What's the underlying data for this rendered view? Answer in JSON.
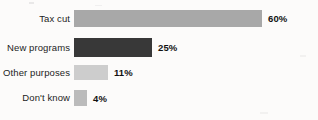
{
  "chart_data": {
    "type": "bar",
    "orientation": "horizontal",
    "title": "",
    "xlabel": "",
    "ylabel": "",
    "grid": false,
    "legend": null,
    "axis_visible": false,
    "xlim": [
      0,
      60
    ],
    "categories": [
      "Tax cut",
      "New programs",
      "Other purposes",
      "Don't know"
    ],
    "values": [
      60,
      25,
      11,
      4
    ],
    "value_labels": [
      "60%",
      "25%",
      "11%",
      "4%"
    ],
    "bar_colors": [
      "#a8a8a8",
      "#383838",
      "#cdcdcd",
      "#bbbbbb"
    ],
    "background_color": "#fcfbfa",
    "text_color": "#1d1d1d"
  }
}
